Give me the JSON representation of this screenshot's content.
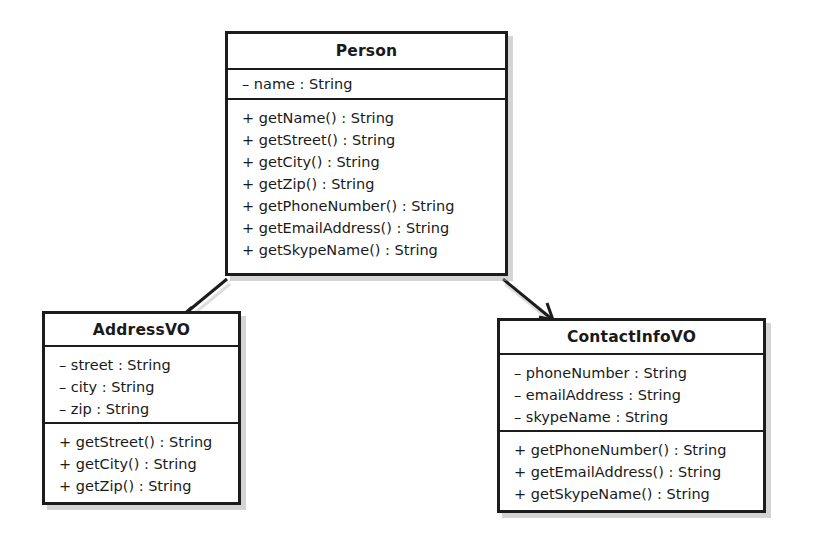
{
  "diagram": {
    "type": "uml-class-diagram",
    "background_color": "#ffffff",
    "line_color": "#1c1c1c",
    "shadow_color": "#a0a0a0",
    "classes": [
      {
        "id": "person",
        "name": "Person",
        "attributes": [
          "– name : String"
        ],
        "methods": [
          "+ getName() : String",
          "+ getStreet() : String",
          "+ getCity() : String",
          "+ getZip() : String",
          "+ getPhoneNumber() : String",
          "+ getEmailAddress() : String",
          "+ getSkypeName() : String"
        ]
      },
      {
        "id": "addressvo",
        "name": "AddressVO",
        "attributes": [
          "– street : String",
          "– city : String",
          "– zip : String"
        ],
        "methods": [
          "+ getStreet() : String",
          "+ getCity() : String",
          "+ getZip() : String"
        ]
      },
      {
        "id": "contactinfovo",
        "name": "ContactInfoVO",
        "attributes": [
          "– phoneNumber : String",
          "– emailAddress : String",
          "– skypeName : String"
        ],
        "methods": [
          "+ getPhoneNumber() : String",
          "+ getEmailAddress() : String",
          "+ getSkypeName() : String"
        ]
      }
    ],
    "connectors": [
      {
        "id": "person-to-addressvo",
        "from": "person",
        "to": "addressvo",
        "arrowhead": "open",
        "style": "solid"
      },
      {
        "id": "person-to-contactinfovo",
        "from": "person",
        "to": "contactinfovo",
        "arrowhead": "open",
        "style": "solid"
      }
    ]
  }
}
